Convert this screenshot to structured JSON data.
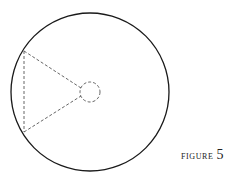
{
  "figure": {
    "caption_word": "FIGURE",
    "caption_number": "5",
    "outer_circle": {
      "cx": 90,
      "cy": 92,
      "r": 79,
      "stroke": "#1a1a1a",
      "style": "solid"
    },
    "inner_circle": {
      "cx": 90,
      "cy": 92,
      "r": 10,
      "stroke": "#555555",
      "style": "dashed"
    },
    "triangle": {
      "vertices": [
        [
          24,
          51
        ],
        [
          24,
          132
        ],
        [
          81,
          87
        ],
        [
          81,
          97
        ]
      ],
      "stroke": "#555555",
      "style": "dashed"
    }
  }
}
